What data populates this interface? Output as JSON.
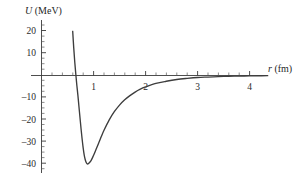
{
  "figure": {
    "background_color": "#ffffff",
    "curve_color": "#3d3d3d",
    "axis_color": "#3a3a3a",
    "text_color": "#2b2b2b"
  },
  "labels": {
    "y_axis_symbol": "U",
    "y_axis_unit": "(MeV)",
    "y_axis_title": "U (MeV)",
    "x_axis_symbol": "r",
    "x_axis_unit": "(fm)",
    "x_axis_title": "r (fm)"
  },
  "ticks": {
    "x_major_labels": [
      "1",
      "2",
      "3",
      "4"
    ],
    "x_major_values": [
      1,
      2,
      3,
      4
    ],
    "y_major_labels": [
      "20",
      "10",
      "–10",
      "–20",
      "–30",
      "–40"
    ],
    "y_major_values": [
      20,
      10,
      -10,
      -20,
      -30,
      -40
    ],
    "x_minor_step": 0.2,
    "y_minor_step": 2.5
  },
  "chart_data": {
    "type": "line",
    "title": "",
    "subtitle": "",
    "xlabel": "r (fm)",
    "ylabel": "U (MeV)",
    "xlim": [
      0,
      4.35
    ],
    "ylim": [
      -44,
      22
    ],
    "grid": false,
    "legend": false,
    "legend_position": "none",
    "series": [
      {
        "name": "Nuclear potential U(r)",
        "x": [
          0.6,
          0.62,
          0.64,
          0.66,
          0.68,
          0.7,
          0.72,
          0.74,
          0.76,
          0.78,
          0.8,
          0.82,
          0.84,
          0.86,
          0.88,
          0.9,
          0.95,
          1.0,
          1.05,
          1.1,
          1.15,
          1.2,
          1.3,
          1.4,
          1.5,
          1.6,
          1.7,
          1.8,
          1.9,
          2.0,
          2.2,
          2.4,
          2.6,
          2.8,
          3.0,
          3.2,
          3.4,
          3.6,
          3.8,
          4.0,
          4.2,
          4.35
        ],
        "y": [
          20.0,
          12.5,
          6.0,
          0.5,
          -4.5,
          -9.0,
          -14.0,
          -19.0,
          -24.0,
          -28.5,
          -32.5,
          -35.8,
          -38.0,
          -39.4,
          -40.0,
          -39.9,
          -38.6,
          -36.2,
          -33.4,
          -30.5,
          -27.6,
          -24.9,
          -20.2,
          -16.4,
          -13.4,
          -11.0,
          -9.1,
          -7.5,
          -6.2,
          -5.2,
          -3.6,
          -2.6,
          -1.8,
          -1.3,
          -0.9,
          -0.7,
          -0.5,
          -0.35,
          -0.25,
          -0.18,
          -0.12,
          -0.08
        ]
      }
    ],
    "annotations": [
      {
        "text": "minimum depth",
        "r": 0.88,
        "U": -40.0
      },
      {
        "text": "zero crossing",
        "r": 0.665,
        "U": 0.0
      }
    ]
  }
}
